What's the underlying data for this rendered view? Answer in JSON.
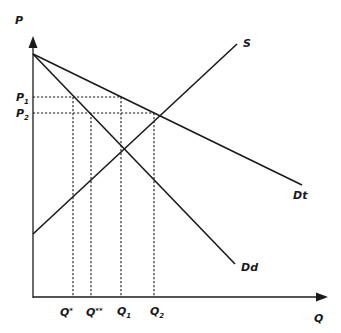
{
  "diagram": {
    "type": "supply-demand",
    "axes": {
      "y_label": "P",
      "x_label": "Q"
    },
    "curves": [
      {
        "id": "S",
        "label": "S"
      },
      {
        "id": "Dt",
        "label": "Dt"
      },
      {
        "id": "Dd",
        "label": "Dd"
      }
    ],
    "price_levels": [
      {
        "main": "P",
        "sub": "1"
      },
      {
        "main": "P",
        "sub": "2"
      }
    ],
    "quantity_levels": [
      {
        "main": "Q",
        "sup": "*"
      },
      {
        "main": "Q",
        "sup": "**"
      },
      {
        "main": "Q",
        "sub": "1"
      },
      {
        "main": "Q",
        "sub": "2"
      }
    ],
    "colors": {
      "ink": "#1a1a1a",
      "background": "#ffffff"
    }
  }
}
